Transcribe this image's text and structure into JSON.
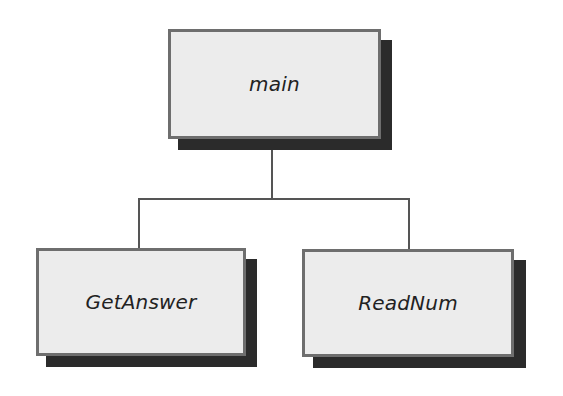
{
  "diagram": {
    "type": "tree",
    "root": {
      "label": "main",
      "children": [
        "GetAnswer",
        "ReadNum"
      ]
    },
    "nodes": [
      {
        "id": "main",
        "label": "main",
        "x": 168,
        "y": 29,
        "w": 213,
        "h": 110
      },
      {
        "id": "getanswer",
        "label": "GetAnswer",
        "x": 36,
        "y": 248,
        "w": 210,
        "h": 108
      },
      {
        "id": "readnum",
        "label": "ReadNum",
        "x": 302,
        "y": 249,
        "w": 212,
        "h": 108
      }
    ],
    "edges": [
      {
        "from": "main",
        "to": "GetAnswer"
      },
      {
        "from": "main",
        "to": "ReadNum"
      }
    ],
    "colors": {
      "box_fill": "#ececec",
      "box_border": "#6e6e6e",
      "shadow": "#2b2b2b",
      "connector": "#555555"
    }
  }
}
